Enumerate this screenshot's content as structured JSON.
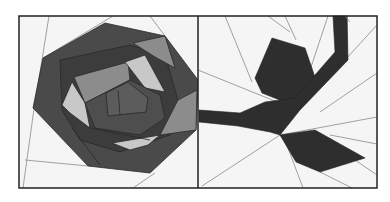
{
  "figure": {
    "panels": [
      {
        "name": "rose-block",
        "title": ""
      },
      {
        "name": "leaf-stem-block",
        "title": ""
      }
    ]
  },
  "colors": {
    "background": "#ffffff",
    "block_bg": "#f5f5f5",
    "frame": "#222222",
    "seam": "#8a8a8a",
    "dark": "#3a3a3a",
    "mid_dark": "#4a4a4a",
    "mid": "#5c5c5c",
    "gray": "#8c8c8c",
    "light": "#c8c8c8",
    "leaf": "#2e2e2e"
  }
}
